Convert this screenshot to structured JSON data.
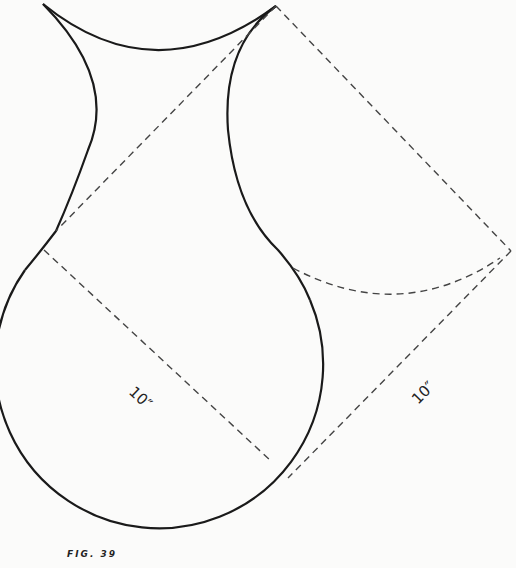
{
  "figure": {
    "caption": "FIG. 39",
    "dimension_left": "10″",
    "dimension_right": "10″",
    "colors": {
      "line": "#1a1a1a",
      "dashed": "#444444",
      "background": "#fbfbfa"
    }
  }
}
